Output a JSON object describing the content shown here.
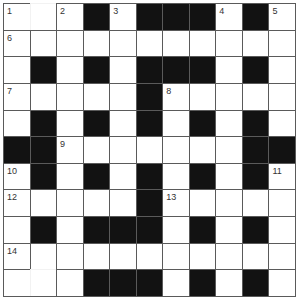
{
  "puzzle": {
    "type": "crossword",
    "size": {
      "rows": 11,
      "cols": 11
    },
    "colors": {
      "block": "#121212",
      "cell": "#ffffff",
      "line": "#5a5a5a"
    },
    "grid": [
      "W W W B W B B B W B W",
      "W W W W W W W W W W W",
      "W B W B W B B B W B W",
      "W W W W W B W W W W W",
      "W B W B W B W B W B W",
      "B B W W W W W W W B B",
      "W B W B W B W B W B W",
      "W W W W W B W W W W W",
      "W B W B B B W B W B W",
      "W W W W W W W W W W W",
      "W W W B B B W B W B W"
    ],
    "faint_cells": [
      [
        0,
        1
      ],
      [
        10,
        1
      ]
    ],
    "numbers": [
      {
        "row": 0,
        "col": 0,
        "label": "1"
      },
      {
        "row": 0,
        "col": 2,
        "label": "2"
      },
      {
        "row": 0,
        "col": 4,
        "label": "3"
      },
      {
        "row": 0,
        "col": 8,
        "label": "4"
      },
      {
        "row": 0,
        "col": 10,
        "label": "5"
      },
      {
        "row": 1,
        "col": 0,
        "label": "6"
      },
      {
        "row": 3,
        "col": 0,
        "label": "7"
      },
      {
        "row": 3,
        "col": 6,
        "label": "8"
      },
      {
        "row": 5,
        "col": 2,
        "label": "9"
      },
      {
        "row": 6,
        "col": 0,
        "label": "10"
      },
      {
        "row": 6,
        "col": 10,
        "label": "11"
      },
      {
        "row": 7,
        "col": 0,
        "label": "12"
      },
      {
        "row": 7,
        "col": 6,
        "label": "13"
      },
      {
        "row": 9,
        "col": 0,
        "label": "14"
      }
    ]
  }
}
